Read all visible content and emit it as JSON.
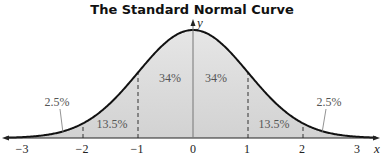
{
  "title": "The Standard Normal Curve",
  "axes": {
    "x_label": "x",
    "y_label": "y"
  },
  "ticks": [
    "−3",
    "−2",
    "−1",
    "0",
    "1",
    "2",
    "3"
  ],
  "regions": {
    "left_tail": "2.5%",
    "left_mid": "13.5%",
    "left_center": "34%",
    "right_center": "34%",
    "right_mid": "13.5%",
    "right_tail": "2.5%"
  },
  "chart_data": {
    "type": "area",
    "title": "The Standard Normal Curve",
    "xlabel": "x",
    "ylabel": "y",
    "x_ticks": [
      -3,
      -2,
      -1,
      0,
      1,
      2,
      3
    ],
    "regions": [
      {
        "from": "-inf",
        "to": -2,
        "percent": 2.5
      },
      {
        "from": -2,
        "to": -1,
        "percent": 13.5
      },
      {
        "from": -1,
        "to": 0,
        "percent": 34
      },
      {
        "from": 0,
        "to": 1,
        "percent": 34
      },
      {
        "from": 1,
        "to": 2,
        "percent": 13.5
      },
      {
        "from": 2,
        "to": "inf",
        "percent": 2.5
      }
    ],
    "dashed_lines_at": [
      -2,
      -1,
      1,
      2
    ]
  }
}
